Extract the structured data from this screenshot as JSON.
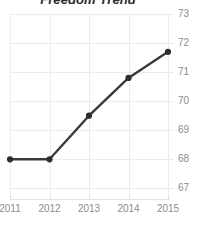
{
  "chart_data": {
    "type": "line",
    "title": "Freedom Trend",
    "xlabel": "",
    "ylabel": "",
    "categories": [
      "2011",
      "2012",
      "2013",
      "2014",
      "2015"
    ],
    "x": [
      2011,
      2012,
      2013,
      2014,
      2015
    ],
    "values": [
      68.0,
      68.0,
      69.5,
      70.8,
      71.7
    ],
    "series": [
      {
        "name": "Freedom Score",
        "values": [
          68.0,
          68.0,
          69.5,
          70.8,
          71.7
        ]
      }
    ],
    "xlim": [
      2011,
      2015
    ],
    "ylim": [
      66.6,
      73.0
    ],
    "yticks": [
      67,
      68,
      69,
      70,
      71,
      72,
      73
    ],
    "ytick_labels": [
      "67",
      "68",
      "69",
      "70",
      "71",
      "72",
      "73"
    ],
    "xticks": [
      2011,
      2012,
      2013,
      2014,
      2015
    ],
    "xtick_labels": [
      "2011",
      "2012",
      "2013",
      "2014",
      "2015"
    ],
    "grid": true,
    "grid_axis": "both",
    "legend": false,
    "legend_position": "none",
    "y_axis_side": "right",
    "markers": "circle",
    "colors": {
      "line": "#3a3a3a",
      "marker": "#2e2e2e",
      "grid": "#ececec",
      "axis": "#e2e2e2",
      "tick_label": "#8c8c8c",
      "title": "#2b2b2b",
      "background": "#ffffff"
    }
  }
}
